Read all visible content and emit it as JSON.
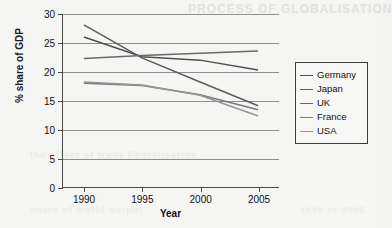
{
  "page": {
    "ghost_artifacts": {
      "top": "PROCESS OF GLOBALISATION",
      "b1": "the effect of trade liberalisation",
      "b2": "share of world output",
      "b3": "1990 to 2005"
    }
  },
  "chart_data": {
    "type": "line",
    "title": "",
    "xlabel": "Year",
    "ylabel": "% share of GDP",
    "x": [
      1990,
      1995,
      2000,
      2005
    ],
    "xlim": [
      1988.2,
      2006.8
    ],
    "ylim": [
      0,
      30
    ],
    "yticks": [
      0,
      5,
      10,
      15,
      20,
      25,
      30
    ],
    "xticks": [
      "1990",
      "1995",
      "2000",
      "2005"
    ],
    "grid": "horizontal",
    "legend_position": "right",
    "series": [
      {
        "name": "Germany",
        "values": [
          26.0,
          22.6,
          22.0,
          20.3
        ],
        "color": "#4f4f4f"
      },
      {
        "name": "Japan",
        "values": [
          28.1,
          22.4,
          18.2,
          14.1
        ],
        "color": "#5c5c5c"
      },
      {
        "name": "UK",
        "values": [
          22.3,
          22.8,
          23.2,
          23.6
        ],
        "color": "#6a6a6a"
      },
      {
        "name": "France",
        "values": [
          18.0,
          17.6,
          16.0,
          13.4
        ],
        "color": "#7a7a7a"
      },
      {
        "name": "USA",
        "values": [
          18.2,
          17.7,
          15.9,
          12.3
        ],
        "color": "#949494"
      }
    ]
  },
  "legend": {
    "items": [
      "Germany",
      "Japan",
      "UK",
      "France",
      "USA"
    ]
  }
}
